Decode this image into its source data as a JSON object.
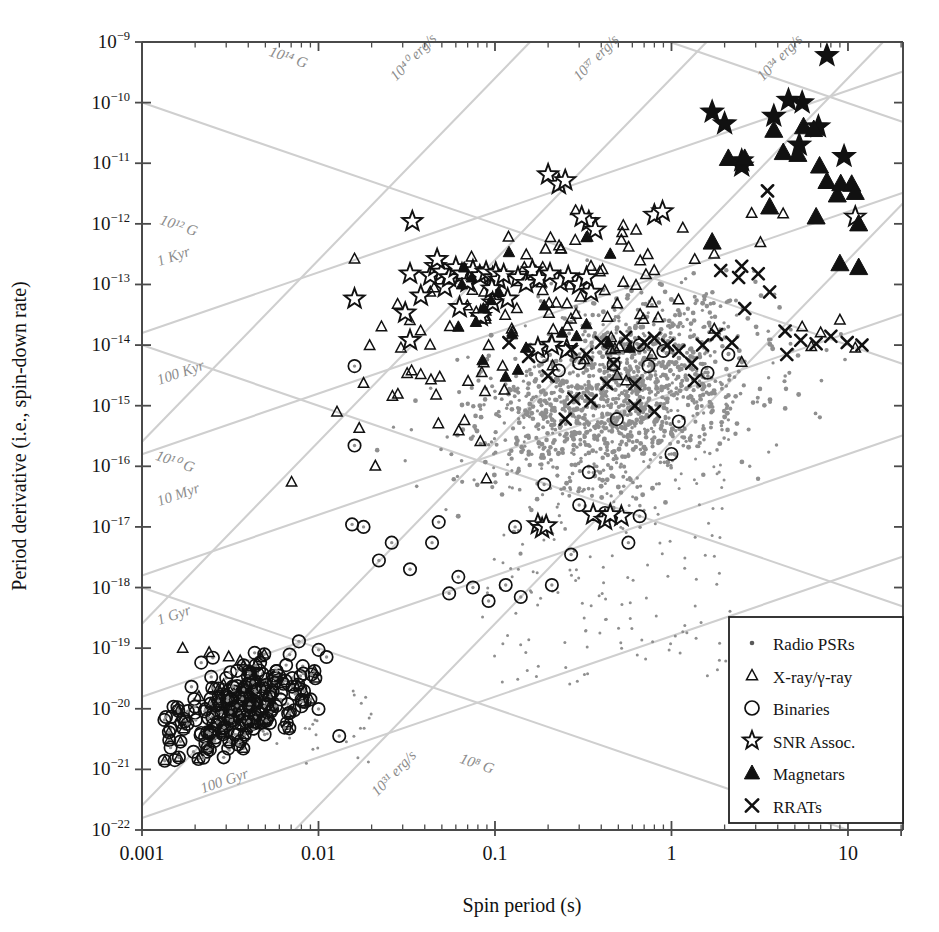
{
  "figure": {
    "type": "P-Pdot diagram",
    "width": 939,
    "height": 932,
    "background": "#ffffff",
    "guide_color": "#cfcfcf",
    "radio_dot_color": "#8f8f8f",
    "marker_color": "#111111"
  },
  "axes": {
    "xlabel": "Spin period (s)",
    "ylabel": "Period derivative (i.e., spin-down rate)",
    "xscale": "log",
    "yscale": "log",
    "xlim": [
      0.001,
      20.5
    ],
    "ylim": [
      1e-22,
      1e-09
    ],
    "xticklabels": [
      "0.001",
      "0.01",
      "0.1",
      "1",
      "10"
    ],
    "xtickvalues": [
      0.001,
      0.01,
      0.1,
      1,
      10
    ],
    "ytickmantissa": "10",
    "ytickexponents": [
      "-9",
      "-10",
      "-11",
      "-12",
      "-13",
      "-14",
      "-15",
      "-16",
      "-17",
      "-18",
      "-19",
      "-20",
      "-21",
      "-22"
    ],
    "grid": false
  },
  "legend": {
    "position": "lower-right",
    "border": "#222222",
    "items": [
      {
        "label": "Radio PSRs",
        "marker": "dot",
        "icon": "small-dot-icon"
      },
      {
        "label": "X-ray/γ-ray",
        "marker": "open-triangle",
        "icon": "open-triangle-icon"
      },
      {
        "label": "Binaries",
        "marker": "open-circle",
        "icon": "open-circle-icon"
      },
      {
        "label": "SNR Assoc.",
        "marker": "open-star",
        "icon": "open-star-icon"
      },
      {
        "label": "Magnetars",
        "marker": "filled-triangle",
        "icon": "filled-triangle-icon"
      },
      {
        "label": "RRATs",
        "marker": "cross",
        "icon": "cross-icon"
      }
    ]
  },
  "guide_lines": [
    {
      "label": "10¹⁴ G",
      "kind": "magnetic-field",
      "exponent": 14,
      "slope": -1,
      "anchor_p": 0.0155,
      "anchor_pdot": 3.4e-10,
      "label_x": 0.0052,
      "label_y": 6e-10
    },
    {
      "label": "10¹² G",
      "kind": "magnetic-field",
      "exponent": 12,
      "slope": -1,
      "anchor_p": 0.0016,
      "anchor_pdot": 1e-12,
      "label_x": 0.00125,
      "label_y": 1e-12
    },
    {
      "label": "10¹⁰ G",
      "kind": "magnetic-field",
      "exponent": 10,
      "slope": -1,
      "anchor_p": 0.0013,
      "anchor_pdot": 1.2e-16,
      "label_x": 0.00118,
      "label_y": 1.3e-16
    },
    {
      "label": "10⁸ G",
      "kind": "magnetic-field",
      "exponent": 8,
      "slope": -1,
      "anchor_p": 0.09,
      "anchor_pdot": 1e-21,
      "label_x": 0.0625,
      "label_y": 1.3e-21
    },
    {
      "label": "1 Kyr",
      "kind": "characteristic-age",
      "age": "1 Kyr",
      "slope": 1,
      "label_x": 0.00125,
      "label_y": 2e-13
    },
    {
      "label": "100 Kyr",
      "kind": "characteristic-age",
      "age": "100 Kyr",
      "slope": 1,
      "label_x": 0.00125,
      "label_y": 2.2e-15
    },
    {
      "label": "10 Myr",
      "kind": "characteristic-age",
      "age": "10 Myr",
      "slope": 1,
      "label_x": 0.00125,
      "label_y": 2.2e-17
    },
    {
      "label": "1 Gyr",
      "kind": "characteristic-age",
      "age": "1 Gyr",
      "slope": 1,
      "label_x": 0.00125,
      "label_y": 2.4e-19
    },
    {
      "label": "100 Gyr",
      "kind": "characteristic-age",
      "age": "100 Gyr",
      "slope": 1,
      "label_x": 0.0022,
      "label_y": 4e-22
    },
    {
      "label": "10⁴⁰ erg/s",
      "kind": "spin-down-luminosity",
      "exponent": 40,
      "slope": 3,
      "label_x": 0.0275,
      "label_y": 2.2e-10
    },
    {
      "label": "10³⁷ erg/s",
      "kind": "spin-down-luminosity",
      "exponent": 37,
      "slope": 3,
      "label_x": 0.3,
      "label_y": 2.2e-10
    },
    {
      "label": "10³⁴ erg/s",
      "kind": "spin-down-luminosity",
      "exponent": 34,
      "slope": 3,
      "label_x": 3.3,
      "label_y": 2.2e-10
    },
    {
      "label": "10³¹ erg/s",
      "kind": "spin-down-luminosity",
      "exponent": 31,
      "slope": 3,
      "label_x": 0.0215,
      "label_y": 3.5e-22
    }
  ],
  "chart_data": {
    "type": "scatter",
    "title": "",
    "xlabel": "Spin period (s)",
    "ylabel": "Period derivative (i.e., spin-down rate)",
    "xscale": "log",
    "yscale": "log",
    "xlim": [
      0.001,
      20.5
    ],
    "ylim": [
      1e-22,
      1e-09
    ],
    "legend_position": "lower-right",
    "series": [
      {
        "name": "Radio PSRs",
        "marker": "dot",
        "color": "#8f8f8f",
        "count": 1400,
        "distribution": {
          "kind": "lognormal-cloud",
          "log_p_mean": -0.3,
          "log_p_sigma": 0.4,
          "log_pdot_mean": -14.85,
          "log_pdot_sigma": 0.78,
          "correlation": 0.34,
          "clip_xlim": [
            0.012,
            18
          ],
          "clip_ylim": [
            3e-19,
            4e-13
          ]
        }
      },
      {
        "name": "X-ray/γ-ray",
        "marker": "open-triangle",
        "color": "#111111",
        "count": 120,
        "distribution": {
          "kind": "lognormal-cloud",
          "log_p_mean": -0.72,
          "log_p_sigma": 0.56,
          "log_pdot_mean": -13.45,
          "log_pdot_sigma": 0.95,
          "correlation": 0.55,
          "clip_xlim": [
            0.0016,
            14
          ],
          "clip_ylim": [
            1e-20,
            2e-12
          ]
        },
        "extras": [
          [
            0.0017,
            1e-19
          ],
          [
            0.0024,
            8.5e-20
          ],
          [
            0.0031,
            7.2e-20
          ],
          [
            0.0036,
            6.2e-20
          ],
          [
            0.0047,
            7e-20
          ],
          [
            0.0029,
            2.5e-20
          ],
          [
            0.0021,
            1.6e-20
          ],
          [
            0.004,
            1.3e-20
          ],
          [
            0.0053,
            1.1e-20
          ],
          [
            5.5,
            2e-14
          ],
          [
            7.0,
            1.6e-14
          ],
          [
            9.0,
            2.6e-14
          ],
          [
            11.0,
            9e-15
          ],
          [
            6.2,
            9.5e-15
          ]
        ]
      },
      {
        "name": "Binaries",
        "marker": "open-circle",
        "color": "#111111",
        "count": 230,
        "distribution": {
          "kind": "msp-cluster",
          "log_p_mean": -2.45,
          "log_p_sigma": 0.22,
          "log_pdot_mean": -19.95,
          "log_pdot_sigma": 0.38,
          "correlation": 0.45
        },
        "extras": [
          [
            0.016,
            4.5e-15
          ],
          [
            0.016,
            2.2e-16
          ],
          [
            0.018,
            1e-17
          ],
          [
            0.022,
            2.8e-18
          ],
          [
            0.0155,
            1.1e-17
          ],
          [
            0.026,
            5.5e-18
          ],
          [
            0.033,
            2e-18
          ],
          [
            0.044,
            5.5e-18
          ],
          [
            0.048,
            1.2e-17
          ],
          [
            0.055,
            8e-19
          ],
          [
            0.062,
            1.5e-18
          ],
          [
            0.075,
            1e-18
          ],
          [
            0.092,
            6e-19
          ],
          [
            0.115,
            1.1e-18
          ],
          [
            0.14,
            7e-19
          ],
          [
            0.21,
            1.1e-18
          ],
          [
            0.27,
            3.5e-18
          ],
          [
            0.13,
            1e-17
          ],
          [
            0.19,
            5e-17
          ],
          [
            0.3,
            2.3e-17
          ],
          [
            0.42,
            1.7e-17
          ],
          [
            0.57,
            5.5e-18
          ],
          [
            0.66,
            1.5e-17
          ],
          [
            0.34,
            8e-17
          ],
          [
            0.49,
            6e-16
          ],
          [
            1.0,
            1.6e-16
          ],
          [
            1.1,
            5.5e-16
          ],
          [
            0.74,
            4.5e-15
          ],
          [
            0.47,
            4.8e-15
          ],
          [
            0.3,
            5e-15
          ],
          [
            0.23,
            3.8e-15
          ],
          [
            0.185,
            6.5e-15
          ],
          [
            1.6,
            3.5e-15
          ],
          [
            2.1,
            7e-15
          ],
          [
            0.9,
            8e-15
          ],
          [
            0.66,
            1e-14
          ]
        ]
      },
      {
        "name": "SNR Assoc.",
        "marker": "open-star",
        "color": "#111111",
        "points": [
          [
            0.016,
            5.8e-14
          ],
          [
            0.034,
            1.1e-12
          ],
          [
            0.033,
            1.5e-13
          ],
          [
            0.031,
            3.4e-14
          ],
          [
            0.033,
            1.2e-14
          ],
          [
            0.038,
            6.5e-14
          ],
          [
            0.043,
            1.4e-13
          ],
          [
            0.046,
            2e-13
          ],
          [
            0.05,
            1.6e-13
          ],
          [
            0.052,
            9e-14
          ],
          [
            0.055,
            1.3e-13
          ],
          [
            0.047,
            2.6e-13
          ],
          [
            0.06,
            1.9e-13
          ],
          [
            0.065,
            1.5e-13
          ],
          [
            0.063,
            4.2e-14
          ],
          [
            0.07,
            1.1e-13
          ],
          [
            0.075,
            1.7e-13
          ],
          [
            0.082,
            1.4e-13
          ],
          [
            0.089,
            1.6e-13
          ],
          [
            0.097,
            1.3e-13
          ],
          [
            0.101,
            1.55e-13
          ],
          [
            0.105,
            1.2e-13
          ],
          [
            0.112,
            1.45e-13
          ],
          [
            0.096,
            8.5e-14
          ],
          [
            0.118,
            5.8e-14
          ],
          [
            0.083,
            3e-14
          ],
          [
            0.097,
            5e-14
          ],
          [
            0.135,
            1.3e-13
          ],
          [
            0.15,
            1.05e-13
          ],
          [
            0.163,
            1.7e-13
          ],
          [
            0.178,
            1.25e-13
          ],
          [
            0.205,
            1.5e-13
          ],
          [
            0.235,
            1.1e-13
          ],
          [
            0.26,
            1.35e-13
          ],
          [
            0.3,
            1e-13
          ],
          [
            0.35,
            7.5e-14
          ],
          [
            0.33,
            1.3e-13
          ],
          [
            0.175,
            9e-15
          ],
          [
            0.21,
            1e-14
          ],
          [
            0.255,
            8.5e-15
          ],
          [
            0.175,
            1.1e-17
          ],
          [
            0.185,
            9.5e-18
          ],
          [
            0.195,
            1.05e-17
          ],
          [
            0.36,
            1.6e-17
          ],
          [
            0.42,
            1.3e-17
          ],
          [
            0.52,
            1.5e-17
          ],
          [
            0.2,
            6.5e-12
          ],
          [
            0.23,
            4.5e-12
          ],
          [
            0.25,
            5.2e-12
          ],
          [
            0.34,
            1.1e-12
          ],
          [
            0.37,
            8e-13
          ],
          [
            0.31,
            1.3e-12
          ],
          [
            0.8,
            1.4e-12
          ],
          [
            0.89,
            1.6e-12
          ],
          [
            1.7,
            7e-11
          ],
          [
            2.0,
            4.5e-11
          ],
          [
            2.5,
            9e-12
          ],
          [
            3.8,
            6e-11
          ],
          [
            4.6,
            1.1e-10
          ],
          [
            5.5,
            1e-10
          ],
          [
            7.6,
            6e-10
          ],
          [
            6.8,
            4e-11
          ],
          [
            9.5,
            1.3e-11
          ],
          [
            11.0,
            1.3e-12
          ],
          [
            2.5,
            1.1e-11
          ],
          [
            5.3,
            2e-11
          ],
          [
            0.45,
            1.6e-17
          ]
        ]
      },
      {
        "name": "Magnetars",
        "marker": "filled-triangle",
        "color": "#111111",
        "points": [
          [
            2.1,
            1.2e-11
          ],
          [
            2.6,
            1.2e-11
          ],
          [
            3.8,
            3.5e-11
          ],
          [
            4.3,
            1.5e-11
          ],
          [
            5.2,
            1.4e-11
          ],
          [
            5.6,
            4e-11
          ],
          [
            6.4,
            3.6e-11
          ],
          [
            6.9,
            9e-12
          ],
          [
            7.6,
            5e-12
          ],
          [
            8.7,
            3e-12
          ],
          [
            9.1,
            4.6e-12
          ],
          [
            10.5,
            4.5e-12
          ],
          [
            11.0,
            3.3e-12
          ],
          [
            11.5,
            1e-12
          ],
          [
            6.6,
            1.3e-12
          ],
          [
            9.0,
            2.2e-13
          ],
          [
            11.5,
            1.9e-13
          ],
          [
            3.6,
            1.9e-12
          ],
          [
            1.7,
            5e-13
          ],
          [
            0.33,
            6e-13
          ],
          [
            0.45,
            3.2e-13
          ],
          [
            0.12,
            3.4e-13
          ],
          [
            0.19,
            4.5e-14
          ],
          [
            0.095,
            5.5e-14
          ],
          [
            0.125,
            1.5e-14
          ],
          [
            0.33,
            2.2e-14
          ],
          [
            0.065,
            1e-13
          ],
          [
            0.105,
            7.5e-14
          ],
          [
            0.086,
            4e-14
          ],
          [
            0.24,
            1.6e-14
          ],
          [
            0.062,
            2e-14
          ],
          [
            0.078,
            2.4e-14
          ],
          [
            0.15,
            9e-15
          ],
          [
            0.29,
            1.4e-14
          ],
          [
            0.44,
            1.1e-14
          ],
          [
            0.58,
            9e-15
          ],
          [
            0.085,
            5.6e-15
          ],
          [
            0.115,
            3e-15
          ],
          [
            0.135,
            3.9e-15
          ],
          [
            0.067,
            1.9e-13
          ],
          [
            0.074,
            1.3e-13
          ]
        ]
      },
      {
        "name": "RRATs",
        "marker": "cross",
        "color": "#111111",
        "points": [
          [
            0.12,
            1.1e-14
          ],
          [
            0.155,
            6.5e-15
          ],
          [
            0.2,
            3.1e-15
          ],
          [
            0.27,
            8.5e-15
          ],
          [
            0.33,
            7e-15
          ],
          [
            0.4,
            1.1e-14
          ],
          [
            0.47,
            5e-15
          ],
          [
            0.55,
            1.35e-14
          ],
          [
            0.62,
            2.3e-15
          ],
          [
            0.7,
            1.1e-14
          ],
          [
            0.8,
            1.3e-14
          ],
          [
            0.95,
            1e-14
          ],
          [
            1.1,
            8e-15
          ],
          [
            1.3,
            5e-15
          ],
          [
            1.5,
            1e-14
          ],
          [
            1.8,
            1.5e-14
          ],
          [
            2.2,
            1.1e-14
          ],
          [
            2.6,
            4e-14
          ],
          [
            3.1,
            1.5e-13
          ],
          [
            3.6,
            7.5e-14
          ],
          [
            1.9,
            1.7e-13
          ],
          [
            2.4,
            1.3e-13
          ],
          [
            4.4,
            1.7e-14
          ],
          [
            5.4,
            1.2e-14
          ],
          [
            6.6,
            1.05e-14
          ],
          [
            8.0,
            1.4e-14
          ],
          [
            9.9,
            1.1e-14
          ],
          [
            12.0,
            1e-14
          ],
          [
            0.43,
            2.3e-15
          ],
          [
            0.35,
            1.2e-15
          ],
          [
            0.28,
            1.3e-15
          ],
          [
            0.8,
            8e-16
          ],
          [
            0.62,
            1e-15
          ],
          [
            3.5,
            3.5e-12
          ],
          [
            2.5,
            2e-13
          ],
          [
            4.5,
            7e-15
          ],
          [
            1.35,
            2.6e-15
          ],
          [
            0.25,
            6e-16
          ]
        ]
      }
    ]
  }
}
